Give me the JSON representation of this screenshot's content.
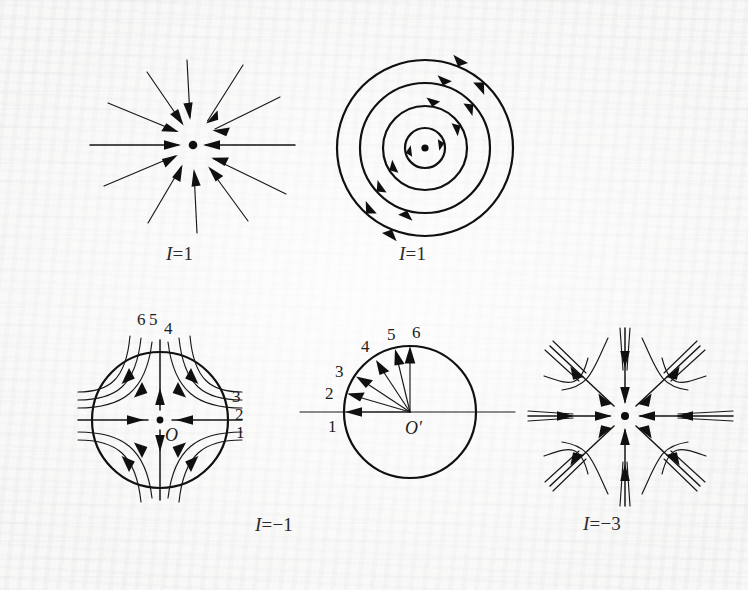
{
  "figure": {
    "background_color": "#f7f7f6",
    "ink_color": "#151515",
    "width": 748,
    "height": 590
  },
  "panels": [
    {
      "id": "radial-node",
      "name": "radial-sink-node",
      "caption_italic": "I",
      "caption_rest": "=1",
      "caption_full": "I=1",
      "index_value": 1,
      "ray_count": 12,
      "arrow_direction": "inward",
      "center_marker": "dot"
    },
    {
      "id": "center-vortex",
      "name": "center-vortex",
      "caption_italic": "I",
      "caption_rest": "=1",
      "caption_full": "I=1",
      "index_value": 1,
      "circle_count": 4,
      "circle_radii": [
        18,
        38,
        58,
        78
      ],
      "arrow_direction": "counterclockwise",
      "center_marker": "dot"
    },
    {
      "id": "saddle",
      "name": "saddle-point",
      "caption_italic": "I",
      "caption_rest": "=−1",
      "caption_full": "I=−1",
      "index_value": -1,
      "center_point_label": "O",
      "boundary": "circle",
      "right_labels": [
        "3",
        "2",
        "1"
      ],
      "top_labels": [
        "6",
        "5",
        "4"
      ],
      "inflow_axis": "horizontal",
      "outflow_axis": "vertical"
    },
    {
      "id": "hodograph",
      "name": "hodograph-index-circle",
      "caption_full": "",
      "center_point_label": "O′",
      "boundary": "circle",
      "vector_labels": [
        "1",
        "2",
        "3",
        "4",
        "5",
        "6"
      ],
      "vector_angles_deg": [
        180,
        163,
        146,
        124,
        105,
        90
      ],
      "rotation_sense": "clockwise-numbering-upward"
    },
    {
      "id": "monkey-saddle",
      "name": "higher-order-saddle-star",
      "caption_italic": "I",
      "caption_rest": "=−3",
      "caption_full": "I=−3",
      "index_value": -3,
      "spoke_count": 8,
      "arrow_direction": "inward",
      "center_marker": "dot"
    }
  ],
  "captions": {
    "node": {
      "italic": "I",
      "rest": "=1"
    },
    "vortex": {
      "italic": "I",
      "rest": "=1"
    },
    "saddle": {
      "italic": "I",
      "rest": "=−1"
    },
    "monkey": {
      "italic": "I",
      "rest": "=−3"
    }
  },
  "labels": {
    "saddle_right": [
      "3",
      "2",
      "1"
    ],
    "saddle_top": [
      "6",
      "5",
      "4"
    ],
    "saddle_origin": "O",
    "hodograph_origin": "O′",
    "hodograph_vectors": [
      "1",
      "2",
      "3",
      "4",
      "5",
      "6"
    ]
  }
}
